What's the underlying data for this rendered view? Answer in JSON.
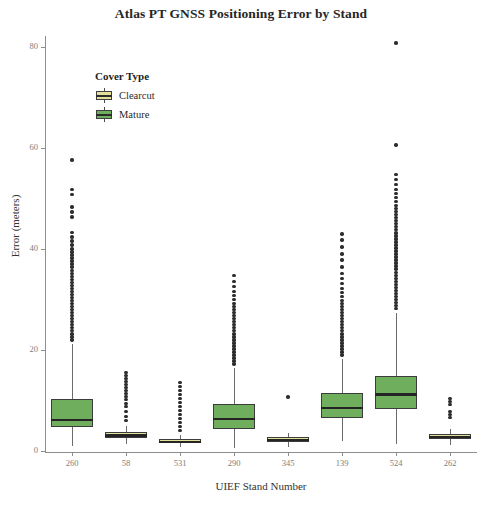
{
  "chart_data": {
    "type": "boxplot",
    "title": "Atlas PT GNSS Positioning Error by Stand",
    "xlabel": "UIEF Stand Number",
    "ylabel": "Error (meters)",
    "ylim": [
      0,
      85
    ],
    "y_ticks": [
      0,
      20,
      40,
      60,
      80
    ],
    "y_tick_labels": [
      "0",
      "20",
      "40",
      "60",
      "80"
    ],
    "grid": false,
    "legend": {
      "title": "Cover Type",
      "position": "top-left-inside",
      "entries": [
        {
          "label": "Clearcut",
          "color": "#e3e09a"
        },
        {
          "label": "Mature",
          "color": "#6fae5c"
        }
      ]
    },
    "categories": [
      "260",
      "58",
      "531",
      "290",
      "345",
      "139",
      "524",
      "262"
    ],
    "boxes": [
      {
        "category": "260",
        "cover_type": "Mature",
        "color": "#6fae5c",
        "min": 1.2,
        "q1": 5.0,
        "median": 6.4,
        "q3": 10.4,
        "max": 21.4,
        "outliers": [
          22.2,
          22.8,
          23.4,
          24.0,
          24.6,
          25.2,
          25.8,
          26.4,
          27.0,
          27.6,
          28.2,
          28.8,
          29.4,
          30.0,
          30.6,
          31.2,
          31.8,
          32.4,
          33.0,
          33.6,
          34.2,
          34.8,
          35.4,
          36.0,
          36.6,
          37.2,
          37.8,
          38.4,
          39.0,
          39.6,
          40.2,
          41.0,
          41.8,
          42.6,
          43.5,
          46.5,
          47.5,
          48.5,
          51.0,
          52.0,
          57.8
        ]
      },
      {
        "category": "58",
        "cover_type": "Clearcut",
        "color": "#e3e09a",
        "min": 1.6,
        "q1": 2.8,
        "median": 3.3,
        "q3": 3.9,
        "max": 5.2,
        "outliers": [
          6.2,
          7.0,
          8.0,
          9.0,
          9.6,
          10.4,
          11.0,
          11.6,
          12.2,
          12.8,
          13.4,
          14.0,
          14.6,
          15.2,
          15.8
        ]
      },
      {
        "category": "531",
        "cover_type": "Clearcut",
        "color": "#e3e09a",
        "min": 0.9,
        "q1": 1.7,
        "median": 2.0,
        "q3": 2.5,
        "max": 3.4,
        "outliers": [
          4.2,
          5.0,
          5.8,
          6.6,
          7.4,
          8.2,
          9.0,
          9.8,
          10.6,
          11.4,
          12.2,
          13.0,
          13.8
        ]
      },
      {
        "category": "290",
        "cover_type": "Mature",
        "color": "#6fae5c",
        "min": 0.8,
        "q1": 4.6,
        "median": 6.6,
        "q3": 9.6,
        "max": 16.6,
        "outliers": [
          17.4,
          18.0,
          18.6,
          19.2,
          19.8,
          20.4,
          21.0,
          21.6,
          22.2,
          22.8,
          23.4,
          24.0,
          24.6,
          25.2,
          25.8,
          26.4,
          27.0,
          27.6,
          28.2,
          28.8,
          29.4,
          30.2,
          31.0,
          31.8,
          32.8,
          33.8,
          35.0
        ]
      },
      {
        "category": "345",
        "cover_type": "Clearcut",
        "color": "#e3e09a",
        "min": 1.0,
        "q1": 2.0,
        "median": 2.4,
        "q3": 3.0,
        "max": 3.8,
        "outliers": [
          10.9
        ]
      },
      {
        "category": "139",
        "cover_type": "Mature",
        "color": "#6fae5c",
        "min": 2.2,
        "q1": 6.8,
        "median": 8.8,
        "q3": 11.6,
        "max": 18.4,
        "outliers": [
          19.2,
          19.8,
          20.4,
          21.0,
          21.6,
          22.2,
          22.8,
          23.4,
          24.0,
          24.6,
          25.2,
          25.8,
          26.4,
          27.0,
          27.6,
          28.2,
          28.8,
          29.4,
          30.0,
          30.8,
          31.6,
          32.4,
          33.4,
          34.4,
          35.4,
          36.6,
          38.0,
          39.2,
          40.6,
          42.0,
          43.2
        ]
      },
      {
        "category": "524",
        "cover_type": "Mature",
        "color": "#6fae5c",
        "min": 1.6,
        "q1": 8.6,
        "median": 11.4,
        "q3": 15.0,
        "max": 27.6,
        "outliers": [
          28.4,
          29.0,
          29.6,
          30.2,
          30.8,
          31.4,
          32.0,
          32.6,
          33.2,
          33.8,
          34.4,
          35.0,
          35.6,
          36.2,
          36.8,
          37.4,
          38.0,
          38.6,
          39.2,
          39.8,
          40.4,
          41.0,
          41.6,
          42.2,
          42.8,
          43.4,
          44.0,
          44.6,
          45.2,
          45.8,
          46.4,
          47.0,
          47.6,
          48.2,
          48.8,
          49.6,
          50.4,
          51.2,
          52.0,
          53.0,
          54.0,
          55.0,
          60.8,
          81.0
        ]
      },
      {
        "category": "262",
        "cover_type": "Clearcut",
        "color": "#e3e09a",
        "min": 1.4,
        "q1": 2.6,
        "median": 3.0,
        "q3": 3.6,
        "max": 4.6,
        "outliers": [
          6.8,
          7.4,
          8.0,
          9.4,
          10.0,
          10.6
        ]
      }
    ]
  }
}
